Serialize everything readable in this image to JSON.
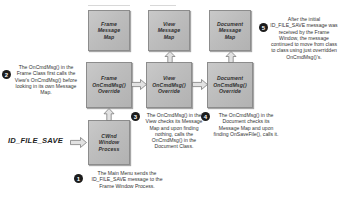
{
  "diagram": {
    "accent_box_fill": "#bdbdbd",
    "accent_box_border": "#8c8c8c",
    "bullet_color": "#1c1c1c",
    "text_color": "#333333"
  },
  "boxes": {
    "frame_message_map": "Frame\nMessage\nMap",
    "view_message_map": "View\nMessage\nMap",
    "document_message_map": "Document\nMessage\nMap",
    "frame_oncmdmsg_override": "Frame\nOnCmdMsg()\nOverride",
    "view_oncmdmsg_override": "View\nOnCmdMsg()\nOverride",
    "document_oncmdmsg_override": "Document\nOnCmdMsg()\nOverride",
    "cwnd_window_process": "CWnd\nWindow\nProcess"
  },
  "labels": {
    "id_file_save": "ID_FILE_SAVE"
  },
  "notes": [
    {
      "number": "1",
      "text": "The Main Menu sends the ID_FILE_SAVE message to the Frame Window Process."
    },
    {
      "number": "2",
      "text": "The OnCmdMsg() in the Frame Class first calls the View's OnCmdMsg() before looking in its own Message Map."
    },
    {
      "number": "3",
      "text": "The OnCmdMsg() in the View checks its Message Map and upon finding nothing, calls the OnCmdMsg() in the Document Class."
    },
    {
      "number": "4",
      "text": "The OnCmdMsg() in the Document checks its Message Map and upon finding OnSaveFile(), calls it."
    },
    {
      "number": "5",
      "text": "After the initial ID_FILE_SAVE message was received by the Frame Window, the message continued to move from class to class using just overridden OnCmdMsg()'s."
    }
  ]
}
